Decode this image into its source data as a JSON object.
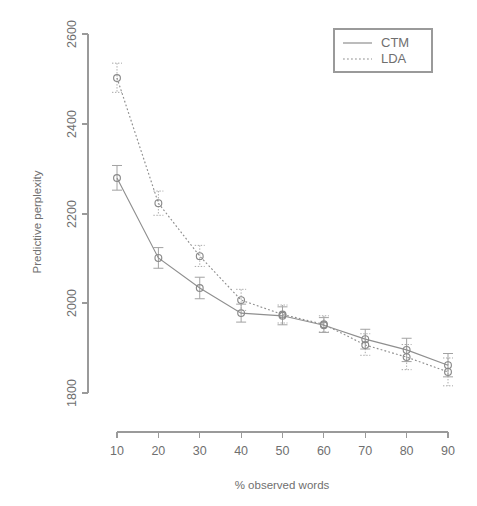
{
  "chart_data": {
    "type": "line",
    "title": "",
    "xlabel": "% observed words",
    "ylabel": "Predictive perplexity",
    "xlim": [
      5,
      95
    ],
    "ylim": [
      1750,
      2620
    ],
    "xticks": [
      10,
      20,
      30,
      40,
      50,
      60,
      70,
      80,
      90
    ],
    "yticks": [
      1800,
      2000,
      2200,
      2400,
      2600
    ],
    "grid": false,
    "legend_position": "top-right",
    "x": [
      10,
      20,
      30,
      40,
      50,
      60,
      70,
      80,
      90
    ],
    "series": [
      {
        "name": "CTM",
        "style": "solid",
        "marker": "open-circle",
        "values": [
          2279,
          2101,
          2034,
          1978,
          1972,
          1951,
          1920,
          1896,
          1862
        ],
        "err_low": [
          2252,
          2078,
          2010,
          1958,
          1952,
          1935,
          1898,
          1870,
          1836
        ],
        "err_high": [
          2307,
          2124,
          2058,
          1998,
          1992,
          1968,
          1942,
          1922,
          1888
        ]
      },
      {
        "name": "LDA",
        "style": "dotted",
        "marker": "open-circle",
        "values": [
          2502,
          2223,
          2105,
          2007,
          1975,
          1953,
          1907,
          1880,
          1847
        ],
        "err_low": [
          2470,
          2196,
          2082,
          1984,
          1956,
          1936,
          1884,
          1852,
          1816
        ],
        "err_high": [
          2535,
          2250,
          2129,
          2031,
          1996,
          1972,
          1932,
          1908,
          1878
        ]
      }
    ],
    "legend_entries": [
      {
        "label": "CTM",
        "style": "solid"
      },
      {
        "label": "LDA",
        "style": "dotted"
      }
    ]
  },
  "axes": {
    "y_tick_labels": [
      "2600",
      "2400",
      "2200",
      "2000",
      "1800"
    ],
    "x_tick_labels": [
      "10",
      "20",
      "30",
      "40",
      "50",
      "60",
      "70",
      "80",
      "90"
    ],
    "y_axis_title": "Predictive perplexity",
    "x_axis_title": "% observed words"
  },
  "legend": {
    "items": [
      {
        "label": "CTM"
      },
      {
        "label": "LDA"
      }
    ]
  },
  "colors": {
    "background": "#ffffff",
    "ink": "#6f6f6f",
    "line": "#8f8f8f",
    "axis": "#9a9a9a"
  }
}
